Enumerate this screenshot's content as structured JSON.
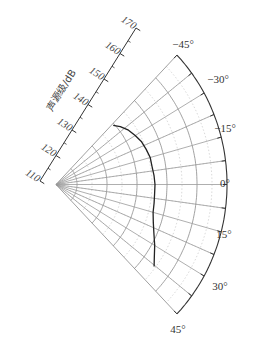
{
  "chart_data": {
    "type": "polar",
    "title": "",
    "radial_axis": {
      "label": "声源级/dB",
      "ticks": [
        110,
        120,
        130,
        140,
        150,
        160,
        170
      ],
      "range": [
        110,
        170
      ]
    },
    "angular_axis": {
      "ticks": [
        -45,
        -30,
        -15,
        0,
        15,
        30,
        45
      ],
      "tick_labels": [
        "−45°",
        "−30°",
        "−15°",
        "0°",
        "15°",
        "30°",
        "45°"
      ],
      "range": [
        -45,
        45
      ]
    },
    "grid": true,
    "series": [
      {
        "name": "source level",
        "angles": [
          -44,
          -40,
          -35,
          -30,
          -25,
          -20,
          -15,
          -10,
          -5,
          0,
          5,
          10,
          15,
          20,
          25,
          30,
          35,
          38
        ],
        "values": [
          139.5,
          141,
          142.5,
          143.5,
          144.5,
          145,
          145.5,
          145.5,
          145.8,
          146,
          146,
          146.2,
          146.5,
          147.5,
          149,
          151,
          153,
          154.5
        ]
      }
    ]
  }
}
